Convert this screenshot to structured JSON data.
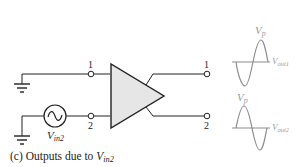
{
  "diagram": {
    "caption_prefix": "(c) Outputs due to ",
    "caption_var": "V",
    "caption_sub": "in2",
    "source_label_var": "V",
    "source_label_sub": "in2",
    "inputs": [
      {
        "terminal": "1",
        "connection": "ground"
      },
      {
        "terminal": "2",
        "connection": "ac-source"
      }
    ],
    "outputs": [
      {
        "terminal": "1",
        "waveform": "inverted-sine",
        "peak_label": "V",
        "peak_sub": "p",
        "out_label": "V",
        "out_sub": "out1"
      },
      {
        "terminal": "2",
        "waveform": "sine",
        "peak_label": "V",
        "peak_sub": "p",
        "out_label": "V",
        "out_sub": "out2"
      }
    ],
    "colors": {
      "line": "#222222",
      "amplifier_fill": "#e6e6e6",
      "waveform": "#8c8c8c",
      "waveform_label": "#9a9a9a"
    }
  }
}
